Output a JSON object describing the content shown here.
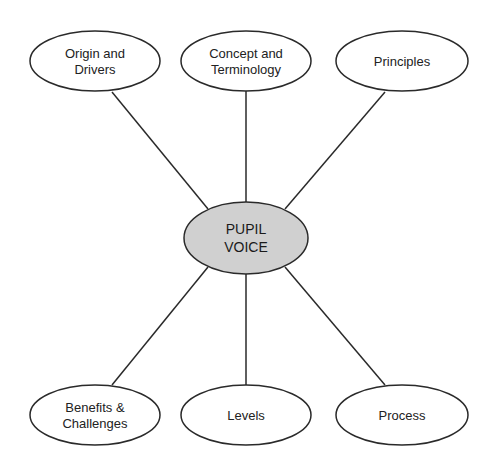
{
  "diagram": {
    "type": "mind-map",
    "colors": {
      "stroke": "#2a2a2a",
      "center_fill": "#d0d0d0",
      "node_fill": "#ffffff",
      "background": "#ffffff"
    },
    "center": {
      "lines": [
        "PUPIL",
        "VOICE"
      ],
      "cx": 246,
      "cy": 238,
      "rx": 62,
      "ry": 36
    },
    "nodes": [
      {
        "id": "origin",
        "lines": [
          "Origin and",
          "Drivers"
        ],
        "cx": 95,
        "cy": 61,
        "rx": 65,
        "ry": 30,
        "line": [
          112,
          92,
          208,
          209
        ]
      },
      {
        "id": "concept",
        "lines": [
          "Concept and",
          "Terminology"
        ],
        "cx": 246,
        "cy": 61,
        "rx": 65,
        "ry": 30,
        "line": [
          246,
          91,
          246,
          202
        ]
      },
      {
        "id": "principles",
        "lines": [
          "Principles"
        ],
        "cx": 402,
        "cy": 61,
        "rx": 66,
        "ry": 30,
        "line": [
          385,
          92,
          285,
          209
        ]
      },
      {
        "id": "benefits",
        "lines": [
          "Benefits &",
          "Challenges"
        ],
        "cx": 95,
        "cy": 415,
        "rx": 65,
        "ry": 30,
        "line": [
          112,
          385,
          208,
          267
        ]
      },
      {
        "id": "levels",
        "lines": [
          "Levels"
        ],
        "cx": 246,
        "cy": 415,
        "rx": 65,
        "ry": 30,
        "line": [
          246,
          385,
          246,
          274
        ]
      },
      {
        "id": "process",
        "lines": [
          "Process"
        ],
        "cx": 402,
        "cy": 415,
        "rx": 66,
        "ry": 30,
        "line": [
          385,
          385,
          285,
          267
        ]
      }
    ]
  }
}
